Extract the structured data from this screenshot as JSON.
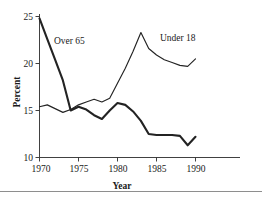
{
  "chart_data": {
    "type": "line",
    "title": "",
    "xlabel": "Year",
    "ylabel": "Percent",
    "xlim": [
      1970,
      1990
    ],
    "ylim": [
      10,
      25
    ],
    "xticks": [
      1970,
      1975,
      1980,
      1985,
      1990
    ],
    "yticks": [
      10,
      15,
      20,
      25
    ],
    "grid": false,
    "legend_position": "inline-annotations",
    "x": [
      1970,
      1971,
      1972,
      1973,
      1974,
      1975,
      1976,
      1977,
      1978,
      1979,
      1980,
      1981,
      1982,
      1983,
      1984,
      1985,
      1986,
      1987,
      1988,
      1989,
      1990
    ],
    "series": [
      {
        "name": "Under 18",
        "style": "thin",
        "values": [
          15.4,
          15.6,
          15.2,
          14.8,
          15.1,
          15.6,
          15.9,
          16.2,
          15.9,
          16.3,
          17.9,
          19.5,
          21.3,
          23.3,
          21.6,
          20.9,
          20.4,
          20.1,
          19.8,
          19.7,
          20.5
        ]
      },
      {
        "name": "Over 65",
        "style": "thick",
        "values": [
          24.8,
          22.6,
          20.4,
          18.2,
          15.0,
          15.4,
          15.1,
          14.5,
          14.1,
          15.0,
          15.8,
          15.6,
          14.9,
          13.9,
          12.5,
          12.4,
          12.4,
          12.4,
          12.3,
          11.3,
          12.2
        ]
      }
    ],
    "annotations": [
      {
        "text": "Over 65",
        "x": 1972.0,
        "y": 21.6
      },
      {
        "text": "Under 18",
        "x": 1983.6,
        "y": 22.1
      }
    ]
  },
  "axes": {
    "y_tick_labels": [
      "25",
      "20",
      "15",
      "10"
    ],
    "x_tick_labels": [
      "1970",
      "1975",
      "1980",
      "1985",
      "1990"
    ],
    "y_title": "Percent",
    "x_title": "Year"
  },
  "labels": {
    "over65": "Over 65",
    "under18": "Under 18"
  },
  "colors": {
    "line": "#232323",
    "axis": "#2b2b2b",
    "text": "#1a1a1a",
    "background": "#ffffff",
    "rule": "#8e8e8e"
  }
}
